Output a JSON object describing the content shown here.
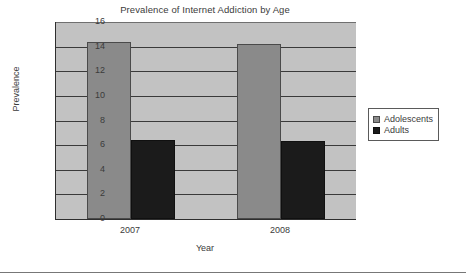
{
  "chart_data": {
    "type": "bar",
    "title": "Prevalence of Internet Addiction by Age",
    "xlabel": "Year",
    "ylabel": "Prevalence",
    "categories": [
      "2007",
      "2008"
    ],
    "series": [
      {
        "name": "Adolescents",
        "values": [
          14.4,
          14.2
        ],
        "color": "#8a8a8a"
      },
      {
        "name": "Adults",
        "values": [
          6.4,
          6.3
        ],
        "color": "#1b1b1b"
      }
    ],
    "ylim": [
      0,
      16
    ],
    "ytick_step": 2,
    "yticks": [
      "16",
      "14",
      "12",
      "10",
      "8",
      "6",
      "4",
      "2",
      "0"
    ],
    "grid": true,
    "legend_position": "right",
    "plot_background": "#c2c2c2"
  },
  "legend": {
    "items": [
      {
        "label": "Adolescents"
      },
      {
        "label": "Adults"
      }
    ]
  }
}
